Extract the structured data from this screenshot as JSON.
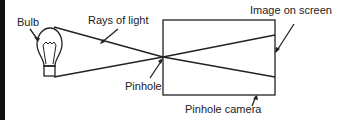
{
  "diagram": {
    "labels": {
      "bulb": "Bulb",
      "rays": "Rays of light",
      "image": "Image on screen",
      "pinhole": "Pinhole",
      "camera": "Pinhole camera"
    },
    "colors": {
      "line": "#222222",
      "background": "#ffffff",
      "left_bar": "#111111"
    }
  }
}
